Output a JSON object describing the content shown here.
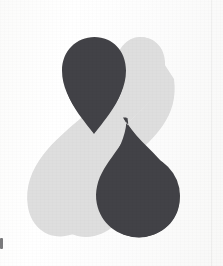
{
  "image": {
    "kind": "scanned-logo-mark",
    "title": "Interlocking Teardrop Logo",
    "description": "Two dark charcoal teardrops and one light grey teardrop interlocking to form a figure-eight / ampersand silhouette on off-white scanned paper.",
    "width": 223,
    "height": 266
  },
  "colors": {
    "background": "#fdfdfd",
    "paper_tint": "#f8f8f7",
    "dark_shape": "#434347",
    "light_shape": "#dedede",
    "edge_line": "rgba(0,0,0,0.045)",
    "artifact": "rgba(40,40,44,0.62)"
  },
  "shapes": [
    {
      "id": "light-teardrop",
      "name": "light-teardrop",
      "fill": "#dedede",
      "role": "background-counterform",
      "orientation": "point-up-right",
      "bounds": {
        "x": 43,
        "y": 37,
        "width": 122,
        "height": 200
      }
    },
    {
      "id": "upper-dark-teardrop",
      "name": "upper-dark-teardrop",
      "fill": "#434347",
      "role": "upper-lobe",
      "orientation": "point-down-right",
      "bounds": {
        "x": 62,
        "y": 37,
        "width": 64,
        "height": 96
      }
    },
    {
      "id": "lower-dark-teardrop",
      "name": "lower-dark-teardrop",
      "fill": "#434347",
      "role": "lower-lobe",
      "orientation": "point-up-left",
      "bounds": {
        "x": 96,
        "y": 118,
        "width": 84,
        "height": 120
      }
    }
  ],
  "artifacts": {
    "left_margin_mark": "small dark speck at left edge",
    "right_scan_line": "faint vertical line near right edge"
  }
}
